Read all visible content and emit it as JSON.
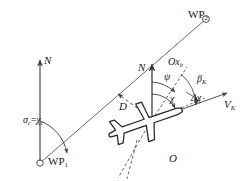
{
  "figure": {
    "kind": "aircraft-guidance-geometry-diagram",
    "background": "#ffffff",
    "stroke": "#3c3c3c",
    "text_color": "#1a1a1a"
  },
  "labels": {
    "wp2": "WP",
    "wp2_sub": "2",
    "wp1": "WP",
    "wp1_sub": "1",
    "north_left": "N",
    "north_center": "N",
    "sigma": "σ",
    "sigma_sub": "c",
    "equals": "=",
    "chi_c": "χ",
    "chi_c_sub": "c",
    "psi": "ψ",
    "chi": "χ",
    "delta_chi": "Δχ",
    "beta": "β",
    "beta_sub": "K",
    "body_axis": "Ox",
    "body_axis_sub": "b",
    "distance": "D",
    "velocity": "V",
    "velocity_sub": "K",
    "origin": "O"
  },
  "geometry": {
    "wp1_point": [
      40,
      163
    ],
    "wp2_point": [
      206,
      19
    ],
    "aircraft_origin": [
      152,
      120
    ],
    "north_left_base": [
      40,
      163
    ],
    "north_left_tip": [
      40,
      58
    ],
    "north_center_base": [
      152,
      120
    ],
    "north_center_tip": [
      152,
      62
    ],
    "velocity_tip": [
      228,
      92
    ],
    "body_axis_tip": [
      186,
      66
    ],
    "distance_arrow_tip": [
      117,
      93
    ]
  }
}
